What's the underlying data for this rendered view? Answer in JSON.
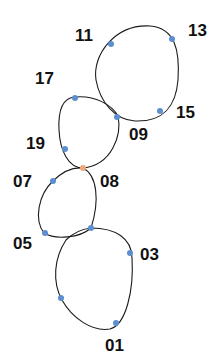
{
  "diagram": {
    "type": "chain-of-loops",
    "colors": {
      "line": "#1a1a1a",
      "dot": "#5b8fd0",
      "highlight_dot": "#f0a878",
      "label": "#111111"
    },
    "loops": [
      {
        "name": "loop-top",
        "path": "M150,26 C175,28 180,50 178,80 C176,105 165,122 135,121 C115,120 100,102 96,80 C92,55 115,24 150,26 Z"
      },
      {
        "name": "loop-upper-middle",
        "path": "M75,97 C95,95 112,105 118,116 C122,135 112,165 83,168 C68,168 60,150 59,130 C58,110 62,98 75,97 Z"
      },
      {
        "name": "loop-lower-middle",
        "path": "M83,168 C97,175 100,200 91,228 C80,238 55,240 44,233 C34,220 38,195 53,181 C62,172 73,167 83,168 Z"
      },
      {
        "name": "loop-bottom",
        "path": "M91,228 C115,228 132,238 132,258 C134,290 126,325 110,329 C92,332 72,318 62,300 C52,282 54,258 66,240 C74,232 82,229 91,228 Z"
      }
    ],
    "points": [
      {
        "label": "11",
        "x": 111,
        "y": 44,
        "highlight": false,
        "lx": 75,
        "ly": 41
      },
      {
        "label": "13",
        "x": 172,
        "y": 39,
        "highlight": false,
        "lx": 188,
        "ly": 36
      },
      {
        "label": "15",
        "x": 160,
        "y": 111,
        "highlight": false,
        "lx": 176,
        "ly": 118
      },
      {
        "label": "09",
        "x": 117,
        "y": 117,
        "highlight": false,
        "lx": 129,
        "ly": 140
      },
      {
        "label": "17",
        "x": 75,
        "y": 98,
        "highlight": false,
        "lx": 35,
        "ly": 84
      },
      {
        "label": "19",
        "x": 65,
        "y": 149,
        "highlight": false,
        "lx": 26,
        "ly": 149
      },
      {
        "label": "08",
        "x": 83,
        "y": 168,
        "highlight": true,
        "lx": 100,
        "ly": 187
      },
      {
        "label": "07",
        "x": 53,
        "y": 181,
        "highlight": false,
        "lx": 13,
        "ly": 187
      },
      {
        "label": "05",
        "x": 45,
        "y": 233,
        "highlight": false,
        "lx": 13,
        "ly": 249
      },
      {
        "label": "",
        "x": 91,
        "y": 228,
        "highlight": false
      },
      {
        "label": "03",
        "x": 130,
        "y": 253,
        "highlight": false,
        "lx": 140,
        "ly": 260
      },
      {
        "label": "",
        "x": 61,
        "y": 298,
        "highlight": false
      },
      {
        "label": "01",
        "x": 116,
        "y": 323,
        "highlight": false,
        "lx": 105,
        "ly": 351
      }
    ]
  }
}
